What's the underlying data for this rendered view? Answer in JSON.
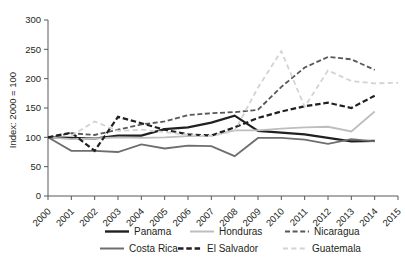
{
  "chart_data": {
    "type": "line",
    "title": "",
    "subtitle": "",
    "xlabel": "",
    "ylabel": "Index: 2000 = 100",
    "xlim": [
      2000,
      2015
    ],
    "ylim": [
      0,
      300
    ],
    "yticks": [
      0,
      50,
      100,
      150,
      200,
      250,
      300
    ],
    "ytick_labels": [
      "0",
      "50",
      "100",
      "150",
      "200",
      "250",
      "300"
    ],
    "xticks": [
      2000,
      2001,
      2002,
      2003,
      2004,
      2005,
      2006,
      2007,
      2008,
      2009,
      2010,
      2011,
      2012,
      2013,
      2014,
      2015
    ],
    "categories": [
      "2000",
      "2001",
      "2002",
      "2003",
      "2004",
      "2005",
      "2006",
      "2007",
      "2008",
      "2009",
      "2010",
      "2011",
      "2012",
      "2013",
      "2014",
      "2015"
    ],
    "grid": false,
    "legend_position": "bottom",
    "series": [
      {
        "name": "Panama",
        "color": "#231f20",
        "dash": "none",
        "width": 2.2,
        "x": [
          2000,
          2001,
          2002,
          2003,
          2004,
          2005,
          2006,
          2007,
          2008,
          2009,
          2010,
          2011,
          2012,
          2013,
          2014
        ],
        "values": [
          100,
          99,
          98,
          103,
          103,
          114,
          117,
          125,
          137,
          111,
          108,
          105,
          99,
          93,
          94
        ]
      },
      {
        "name": "Honduras",
        "color": "#bcbec0",
        "dash": "none",
        "width": 1.8,
        "x": [
          2000,
          2001,
          2002,
          2003,
          2004,
          2005,
          2006,
          2007,
          2008,
          2009,
          2010,
          2011,
          2012,
          2013,
          2014
        ],
        "values": [
          100,
          97,
          98,
          100,
          99,
          100,
          102,
          103,
          112,
          112,
          115,
          117,
          118,
          110,
          144
        ]
      },
      {
        "name": "Nicaragua",
        "color": "#58585b",
        "dash": "dashed-medium",
        "width": 1.8,
        "x": [
          2000,
          2001,
          2002,
          2003,
          2004,
          2005,
          2006,
          2007,
          2008,
          2009,
          2010,
          2011,
          2012,
          2013,
          2014
        ],
        "values": [
          100,
          107,
          104,
          113,
          122,
          127,
          138,
          141,
          143,
          147,
          186,
          219,
          237,
          233,
          215
        ]
      },
      {
        "name": "Costa Rica",
        "color": "#6d6e71",
        "dash": "none",
        "width": 1.8,
        "x": [
          2000,
          2001,
          2002,
          2003,
          2004,
          2005,
          2006,
          2007,
          2008,
          2009,
          2010,
          2011,
          2012,
          2013,
          2014
        ],
        "values": [
          100,
          77,
          77,
          75,
          88,
          81,
          86,
          85,
          68,
          99,
          99,
          96,
          89,
          97,
          93
        ]
      },
      {
        "name": "El Salvador",
        "color": "#231f20",
        "dash": "dashed-long",
        "width": 2.2,
        "x": [
          2000,
          2001,
          2002,
          2003,
          2004,
          2005,
          2006,
          2007,
          2008,
          2009,
          2010,
          2011,
          2012,
          2013,
          2014
        ],
        "values": [
          100,
          108,
          77,
          135,
          124,
          113,
          105,
          103,
          117,
          133,
          144,
          153,
          159,
          150,
          171
        ]
      },
      {
        "name": "Guatemala",
        "color": "#d1d3d4",
        "dash": "dashed-sparse",
        "width": 1.8,
        "x": [
          2001,
          2002,
          2003,
          2004,
          2005,
          2006,
          2007,
          2008,
          2009,
          2010,
          2011,
          2012,
          2013,
          2014,
          2015
        ],
        "values": [
          103,
          127,
          111,
          113,
          109,
          104,
          102,
          111,
          185,
          247,
          152,
          214,
          196,
          192,
          193
        ]
      }
    ]
  },
  "axes": {
    "ylabel": "Index: 2000 = 100"
  },
  "legend": {
    "rows": [
      [
        {
          "label": "Panama",
          "color": "#231f20",
          "dash": "none",
          "width": 2.4
        },
        {
          "label": "Honduras",
          "color": "#bcbec0",
          "dash": "none",
          "width": 2.0
        },
        {
          "label": "Nicaragua",
          "color": "#58585b",
          "dash": "dashed-medium",
          "width": 2.0
        }
      ],
      [
        {
          "label": "Costa Rica",
          "color": "#6d6e71",
          "dash": "none",
          "width": 2.0
        },
        {
          "label": "El Salvador",
          "color": "#231f20",
          "dash": "dashed-long",
          "width": 2.4
        },
        {
          "label": "Guatemala",
          "color": "#d1d3d4",
          "dash": "dashed-sparse",
          "width": 2.0
        }
      ]
    ]
  }
}
